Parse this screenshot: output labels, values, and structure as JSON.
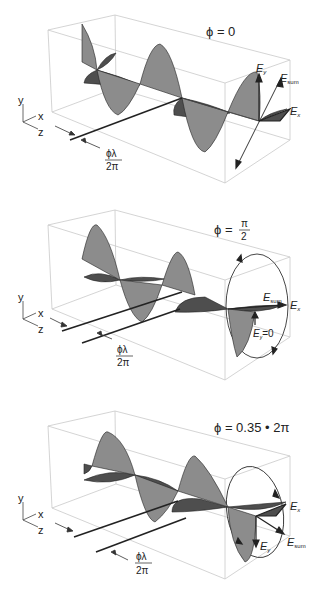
{
  "figure": {
    "panels": [
      {
        "phase_label": "ϕ = 0",
        "axis_labels": {
          "y": "y",
          "x": "x",
          "z": "z"
        },
        "shift_numerator": "ϕλ",
        "shift_denominator": "2π",
        "field_labels": {
          "ey": "E",
          "ey_sub": "y",
          "esum": "E",
          "esum_sub": "sum",
          "ex": "E",
          "ex_sub": "x"
        },
        "polarization": "linear"
      },
      {
        "phase_label": "ϕ =",
        "phase_num": "π",
        "phase_den": "2",
        "axis_labels": {
          "y": "y",
          "x": "x",
          "z": "z"
        },
        "shift_numerator": "ϕλ",
        "shift_denominator": "2π",
        "field_labels": {
          "esum": "E",
          "esum_sub": "sum",
          "ex": "E",
          "ex_sub": "x",
          "ey": "E",
          "ey_sub": "y",
          "ey_value": "=0"
        },
        "polarization": "circular"
      },
      {
        "phase_label": "ϕ = 0.35 • 2π",
        "axis_labels": {
          "y": "y",
          "x": "x",
          "z": "z"
        },
        "shift_numerator": "ϕλ",
        "shift_denominator": "2π",
        "field_labels": {
          "ex": "E",
          "ex_sub": "x",
          "ey": "E",
          "ey_sub": "y",
          "esum": "E",
          "esum_sub": "sum"
        },
        "polarization": "elliptical"
      }
    ],
    "colors": {
      "vertical_wave": "#8a8a8a",
      "horizontal_wave": "#4a4a4a",
      "box_lines": "#c8c8c8",
      "arrows": "#222222"
    }
  }
}
